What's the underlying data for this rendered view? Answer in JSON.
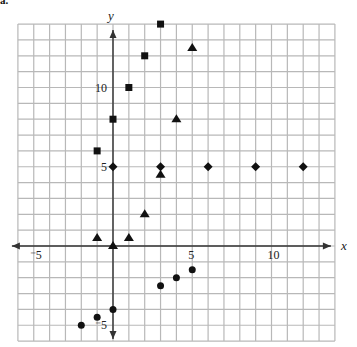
{
  "figure": {
    "part_label": "a."
  },
  "chart_data": {
    "type": "scatter",
    "title": "",
    "xlabel": "x",
    "ylabel": "y",
    "xlim": [
      -6,
      14
    ],
    "ylim": [
      -6,
      14
    ],
    "grid": true,
    "grid_step": 1,
    "legend": null,
    "x_tick_labels": [
      {
        "value": -5,
        "label": "-5"
      },
      {
        "value": 5,
        "label": "5"
      },
      {
        "value": 10,
        "label": "10"
      }
    ],
    "y_tick_labels": [
      {
        "value": -5,
        "label": "-5"
      },
      {
        "value": 5,
        "label": "5"
      },
      {
        "value": 10,
        "label": "10"
      }
    ],
    "series": [
      {
        "name": "squares",
        "marker": "square",
        "color": "#111111",
        "points": [
          [
            -1,
            6
          ],
          [
            0,
            8
          ],
          [
            1,
            10
          ],
          [
            2,
            12
          ],
          [
            3,
            14
          ]
        ]
      },
      {
        "name": "diamonds",
        "marker": "diamond",
        "color": "#111111",
        "points": [
          [
            0,
            5
          ],
          [
            3,
            5
          ],
          [
            6,
            5
          ],
          [
            9,
            5
          ],
          [
            12,
            5
          ]
        ]
      },
      {
        "name": "triangles",
        "marker": "triangle",
        "color": "#111111",
        "points": [
          [
            -1,
            0.5
          ],
          [
            0,
            0
          ],
          [
            1,
            0.5
          ],
          [
            2,
            2
          ],
          [
            3,
            4.5
          ],
          [
            4,
            8
          ],
          [
            5,
            12.5
          ]
        ]
      },
      {
        "name": "circles",
        "marker": "circle",
        "color": "#111111",
        "points": [
          [
            -2,
            -5
          ],
          [
            -1,
            -4.5
          ],
          [
            0,
            -4
          ],
          [
            3,
            -2.5
          ],
          [
            4,
            -2
          ],
          [
            5,
            -1.5
          ]
        ]
      }
    ]
  },
  "colors": {
    "grid": "#b8b8b8",
    "axis": "#333333",
    "marker": "#111111"
  }
}
